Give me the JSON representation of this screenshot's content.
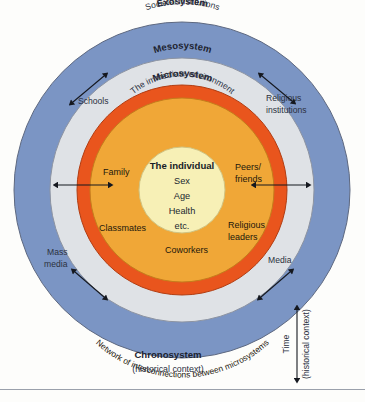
{
  "figure": {
    "background_color": "#fdfdfb"
  },
  "rings": [
    {
      "id": "macrosystem",
      "label": "Macrosystem",
      "sublabel": "Cultural beliefs and values",
      "color": "#7b95c4"
    },
    {
      "id": "exosystem",
      "label": "Exosystem",
      "sublabel": "Societal institutions",
      "color": "#dfe2e6"
    },
    {
      "id": "mesosystem",
      "label": "Mesosystem",
      "sublabel": "Network of interconnections between microsystems",
      "color": "#e9551d"
    },
    {
      "id": "microsystem",
      "label": "Microsystem",
      "sublabel": "The immediate environment",
      "color": "#f0a737"
    },
    {
      "id": "individual",
      "label": "The individual",
      "color": "#f7f0b6"
    }
  ],
  "core": {
    "title": "The individual",
    "items": [
      "Sex",
      "Age",
      "Health",
      "etc."
    ]
  },
  "microsystem_items": {
    "family": "Family",
    "peers": "Peers/",
    "peers_second": "friends",
    "classmates": "Classmates",
    "religious_leaders": "Religious",
    "religious_leaders_second": "leaders",
    "coworkers": "Coworkers"
  },
  "exosystem_items": {
    "schools": "Schools",
    "religious_institutions": "Religious",
    "religious_institutions_second": "institutions",
    "mass_media": "Mass",
    "mass_media_second": "media",
    "media": "Media"
  },
  "chronosystem": {
    "title": "Chronosystem",
    "subtitle": "(historical context)"
  },
  "time_axis": {
    "label": "Time",
    "sublabel": "(historical context)"
  },
  "colors": {
    "macro": "#7b95c4",
    "exo": "#dfe2e6",
    "meso": "#e9551d",
    "micro": "#f0a737",
    "core": "#f7f0b6",
    "outline": "#6a7385",
    "arrow": "#15181f"
  }
}
